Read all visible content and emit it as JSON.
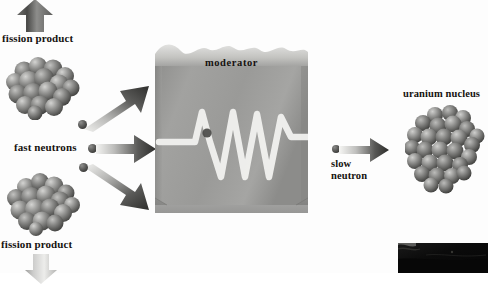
{
  "figure": {
    "background_color": "#fdfdfd"
  },
  "labels": {
    "fission_product_top": "fission product",
    "fission_product_bottom": "fission product",
    "fast_neutrons": "fast neutrons",
    "moderator": "moderator",
    "slow_line1": "slow",
    "slow_line2": "neutron",
    "uranium_nucleus": "uranium nucleus"
  },
  "icons": {
    "fission_product_top_nucleus": "nucleus-cluster-icon",
    "fission_product_bottom_nucleus": "nucleus-cluster-icon",
    "uranium_nucleus": "nucleus-cluster-icon",
    "arrow_up": "arrow-up-icon",
    "arrow_down": "arrow-down-icon",
    "arrow_diagonal_up_right": "arrow-diagonal-up-right-icon",
    "arrow_right_fast": "arrow-right-icon",
    "arrow_diagonal_down_right": "arrow-diagonal-down-right-icon",
    "arrow_right_slow": "arrow-right-icon",
    "moderator_block": "moderator-block-icon",
    "neutron_path": "neutron-zigzag-path-icon",
    "neutron_particle": "neutron-dot-icon"
  },
  "colors": {
    "moderator_fill": "#9a9a98",
    "moderator_top": "#c9c9c6",
    "moderator_shadow": "#7d7d7b",
    "arrow_dark": "#3a3a38",
    "arrow_light": "#e8e8e6",
    "nucleus_sphere": "#8e8e8c",
    "neutron_path_stroke": "#f0f0ee",
    "text": "#15120f",
    "fragment_dark": "#090909"
  },
  "geometry": {
    "canvas_width": 488,
    "canvas_height": 273,
    "moderator_box": [
      155,
      38,
      153,
      175
    ]
  }
}
